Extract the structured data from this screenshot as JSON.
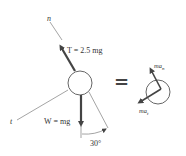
{
  "diagram": {
    "left": {
      "n_axis_label": "n",
      "t_axis_label": "t",
      "tension_label": "T = 2.5 mg",
      "weight_label": "W = mg",
      "angle_label": "30°"
    },
    "equals_sign": "=",
    "right": {
      "normal_accel_label": "ma",
      "normal_accel_sub": "n",
      "tangential_accel_label": "ma",
      "tangential_accel_sub": "t"
    },
    "colors": {
      "line": "#555555",
      "arrow": "#444444",
      "text": "#333333"
    }
  }
}
